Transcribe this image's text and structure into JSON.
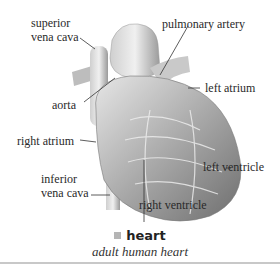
{
  "diagram": {
    "subject": "heart",
    "labels": {
      "superior_vena_cava": [
        "superior",
        "vena cava"
      ],
      "pulmonary_artery": "pulmonary artery",
      "left_atrium": "left atrium",
      "aorta": "aorta",
      "right_atrium": "right atrium",
      "inferior_vena_cava": [
        "inferior",
        "vena cava"
      ],
      "left_ventricle": "left ventricle",
      "right_ventricle": "right ventricle"
    }
  },
  "caption": {
    "title": "heart",
    "subtitle": "adult human heart",
    "marker_color": "#b5b5b5"
  }
}
